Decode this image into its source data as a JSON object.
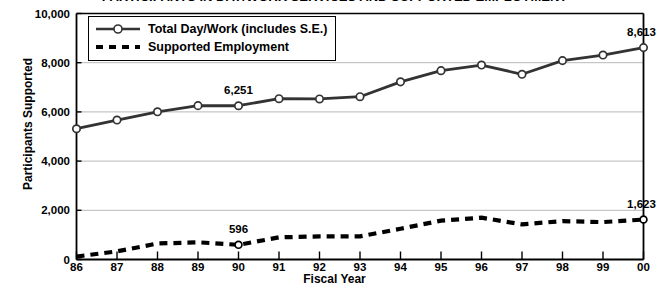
{
  "chart_data": {
    "type": "line",
    "title": "PARTICIPANTS IN DAY/WORK SERVICES AND SUPPORTED EMPLOYMENT",
    "xlabel": "Fiscal Year",
    "ylabel": "Participants Supported",
    "categories": [
      "86",
      "87",
      "88",
      "89",
      "90",
      "91",
      "92",
      "93",
      "94",
      "95",
      "96",
      "97",
      "98",
      "99",
      "00"
    ],
    "x_tick_labels": [
      "86",
      "87",
      "88",
      "89",
      "90",
      "91",
      "92",
      "93",
      "94",
      "95",
      "96",
      "97",
      "98",
      "99",
      "00"
    ],
    "y_tick_labels": [
      "0",
      "2,000",
      "4,000",
      "6,000",
      "8,000",
      "10,000"
    ],
    "y_tick_values": [
      0,
      2000,
      4000,
      6000,
      8000,
      10000
    ],
    "ylim": [
      0,
      10000
    ],
    "grid": "horizontal",
    "legend_position": "top-left-inside",
    "series": [
      {
        "name": "Total Day/Work (includes S.E.)",
        "style": "solid-with-open-circle-markers",
        "color": "#333333",
        "values": [
          5316,
          5668,
          6005,
          6255,
          6251,
          6536,
          6527,
          6617,
          7222,
          7676,
          7904,
          7529,
          8085,
          8310,
          8613
        ]
      },
      {
        "name": "Supported Employment",
        "style": "dashed",
        "color": "#000000",
        "values": [
          120,
          330,
          650,
          700,
          596,
          900,
          940,
          940,
          1250,
          1580,
          1700,
          1430,
          1560,
          1520,
          1623
        ]
      }
    ],
    "annotations": [
      {
        "label": "6,251",
        "series": "Total Day/Work (includes S.E.)",
        "category": "90",
        "value": 6251
      },
      {
        "label": "8,613",
        "series": "Total Day/Work (includes S.E.)",
        "category": "00",
        "value": 8613
      },
      {
        "label": "596",
        "series": "Supported Employment",
        "category": "90",
        "value": 596
      },
      {
        "label": "1,623",
        "series": "Supported Employment",
        "category": "00",
        "value": 1623
      }
    ],
    "legend_entries": [
      {
        "label": "Total Day/Work (includes S.E.)",
        "key": "solid-line-open-circle"
      },
      {
        "label": "Supported Employment",
        "key": "dashed-line"
      }
    ]
  }
}
